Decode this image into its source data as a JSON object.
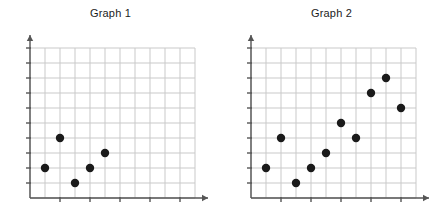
{
  "page": {
    "background_color": "#ffffff",
    "width": 443,
    "height": 220
  },
  "style": {
    "grid_color": "#c9c9c9",
    "axis_color": "#555555",
    "point_color": "#1a1a1a",
    "title_color": "#1c1c1c"
  },
  "graphs": [
    {
      "id": "graph-1",
      "title": "Graph 1",
      "chart_data": {
        "type": "scatter",
        "title": "Graph 1",
        "xlabel": "",
        "ylabel": "",
        "xlim": [
          0,
          10
        ],
        "ylim": [
          0,
          10
        ],
        "grid": true,
        "legend": "none",
        "x_tick_step": 2,
        "y_tick_step": 1,
        "tick_labels_shown": false,
        "n_points": 5,
        "points": [
          {
            "x": 1,
            "y": 2
          },
          {
            "x": 2,
            "y": 4
          },
          {
            "x": 3,
            "y": 1
          },
          {
            "x": 4,
            "y": 2
          },
          {
            "x": 5,
            "y": 3
          }
        ]
      }
    },
    {
      "id": "graph-2",
      "title": "Graph 2",
      "chart_data": {
        "type": "scatter",
        "title": "Graph 2",
        "xlabel": "",
        "ylabel": "",
        "xlim": [
          0,
          10
        ],
        "ylim": [
          0,
          10
        ],
        "grid": true,
        "legend": "none",
        "x_tick_step": 2,
        "y_tick_step": 1,
        "tick_labels_shown": false,
        "n_points": 10,
        "points": [
          {
            "x": 1,
            "y": 2
          },
          {
            "x": 2,
            "y": 4
          },
          {
            "x": 3,
            "y": 1
          },
          {
            "x": 4,
            "y": 2
          },
          {
            "x": 5,
            "y": 3
          },
          {
            "x": 6,
            "y": 5
          },
          {
            "x": 7,
            "y": 4
          },
          {
            "x": 8,
            "y": 7
          },
          {
            "x": 9,
            "y": 8
          },
          {
            "x": 10,
            "y": 6
          }
        ]
      }
    }
  ]
}
